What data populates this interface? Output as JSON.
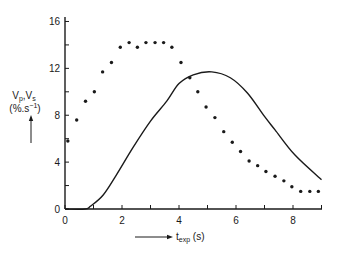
{
  "chart_data": {
    "type": "line",
    "title": "",
    "xlabel": "t_exp (s)",
    "ylabel": "Vp,Vs (%.s^-1)",
    "ylabel_lines": {
      "line1_main": "V",
      "line1_sub1": "p",
      "line1_sep": ",V",
      "line1_sub2": "s",
      "line2": "(%.s",
      "line2_sup": "−1",
      "line2_close": ")"
    },
    "xlabel_parts": {
      "main": "t",
      "sub": "exp",
      "unit": " (s)"
    },
    "xlim": [
      0,
      9.0
    ],
    "ylim": [
      0,
      16
    ],
    "x_ticks": [
      0,
      1,
      2,
      3,
      4,
      5,
      6,
      7,
      8,
      9
    ],
    "x_tick_labels": [
      "0",
      "",
      "2",
      "",
      "4",
      "",
      "6",
      "",
      "8",
      ""
    ],
    "y_ticks": [
      0,
      2,
      4,
      6,
      8,
      10,
      12,
      14,
      16
    ],
    "y_tick_labels": [
      "0",
      "",
      "4",
      "",
      "8",
      "",
      "12",
      "",
      "16"
    ],
    "grid": false,
    "legend": null,
    "series": [
      {
        "name": "Vp",
        "style": "solid-line",
        "color": "#1a1a1a",
        "x": [
          0,
          0.7,
          0.9,
          1.34,
          1.8,
          2.4,
          3.0,
          3.57,
          4.0,
          4.5,
          5.15,
          5.8,
          6.4,
          7.0,
          7.37,
          8.07,
          9.0
        ],
        "y": [
          0,
          0,
          0.25,
          1.2,
          2.9,
          5.3,
          7.5,
          9.2,
          10.7,
          11.45,
          11.7,
          11.2,
          9.9,
          7.9,
          6.75,
          4.6,
          2.5
        ]
      },
      {
        "name": "Vs",
        "style": "dots",
        "color": "#1a1a1a",
        "x": [
          0.1,
          0.41,
          0.72,
          1.03,
          1.32,
          1.63,
          1.94,
          2.25,
          2.54,
          2.84,
          3.16,
          3.46,
          3.75,
          4.07,
          4.38,
          4.66,
          4.95,
          5.26,
          5.57,
          5.87,
          6.16,
          6.46,
          6.76,
          7.05,
          7.37,
          7.68,
          7.96,
          8.27,
          8.59,
          8.89
        ],
        "y": [
          5.8,
          7.6,
          9.2,
          10.0,
          11.7,
          12.5,
          13.8,
          14.2,
          13.8,
          14.2,
          14.2,
          14.2,
          13.8,
          12.5,
          11.2,
          10.0,
          8.7,
          7.8,
          6.6,
          5.7,
          4.9,
          4.1,
          3.7,
          3.2,
          2.8,
          2.4,
          1.9,
          1.5,
          1.5,
          1.5
        ]
      }
    ]
  }
}
